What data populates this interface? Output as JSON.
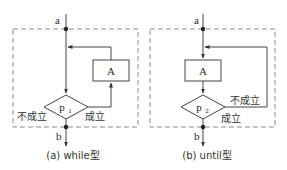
{
  "colors": {
    "line": "#444444",
    "dashed": "#8a8a8a",
    "text": "#2a2a2a",
    "background": "#ffffff"
  },
  "panels": [
    {
      "id": "while",
      "caption": "(a) while型",
      "entry_label": "a",
      "exit_label": "b",
      "process_label": "A",
      "condition_label": "p",
      "condition_subscript": "1",
      "true_label": "成立",
      "false_label": "不成立"
    },
    {
      "id": "until",
      "caption": "(b) until型",
      "entry_label": "a",
      "exit_label": "b",
      "process_label": "A",
      "condition_label": "p",
      "condition_subscript": "2",
      "true_label": "成立",
      "false_label": "不成立"
    }
  ]
}
